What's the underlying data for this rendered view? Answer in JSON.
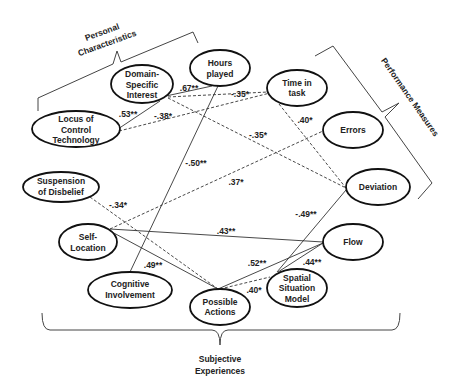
{
  "diagram": {
    "groups": {
      "personal_characteristics": {
        "line1": "Personal",
        "line2": "Characteristics"
      },
      "performance_measures": {
        "label": "Performance Measures"
      },
      "subjective_experiences": {
        "line1": "Subjective",
        "line2": "Experiences"
      }
    },
    "nodes": {
      "domain_specific_interest": {
        "lines": [
          "Domain-",
          "Specific",
          "Interest"
        ]
      },
      "hours_played": {
        "lines": [
          "Hours",
          "played"
        ]
      },
      "time_in_task": {
        "lines": [
          "Time in",
          "task"
        ]
      },
      "locus_of_control": {
        "lines": [
          "Locus of",
          "Control",
          "Technology"
        ]
      },
      "errors": {
        "lines": [
          "Errors"
        ]
      },
      "suspension_of_disbelief": {
        "lines": [
          "Suspension",
          "of Disbelief"
        ]
      },
      "deviation": {
        "lines": [
          "Deviation"
        ]
      },
      "self_location": {
        "lines": [
          "Self-",
          "Location"
        ]
      },
      "flow": {
        "lines": [
          "Flow"
        ]
      },
      "cognitive_involvement": {
        "lines": [
          "Cognitive",
          "Involvement"
        ]
      },
      "possible_actions": {
        "lines": [
          "Possible",
          "Actions"
        ]
      },
      "spatial_situation_model": {
        "lines": [
          "Spatial",
          "Situation",
          "Model"
        ]
      }
    },
    "edges": [
      {
        "from": "Domain-Specific Interest",
        "to": "Hours played",
        "style": "solid",
        "label": ".67**"
      },
      {
        "from": "Domain-Specific Interest",
        "to": "Time in task",
        "style": "dashed",
        "label": "-.35*"
      },
      {
        "from": "Domain-Specific Interest",
        "to": "Deviation",
        "style": "dashed",
        "label": "-.35*"
      },
      {
        "from": "Locus of Control Technology",
        "to": "Domain-Specific Interest",
        "style": "solid",
        "label": ".53**"
      },
      {
        "from": "Locus of Control Technology",
        "to": "Time in task",
        "style": "dashed",
        "label": "-.38*"
      },
      {
        "from": "Hours played",
        "to": "Cognitive Involvement",
        "style": "solid",
        "label": "-.50**"
      },
      {
        "from": "Self-Location",
        "to": "Errors",
        "style": "dashed",
        "label": ".37*"
      },
      {
        "from": "Time in task",
        "to": "Deviation",
        "style": "dashed",
        "label": ".40*"
      },
      {
        "from": "Suspension of Disbelief",
        "to": "Possible Actions",
        "style": "dashed",
        "label": "-.34*"
      },
      {
        "from": "Self-Location",
        "to": "Flow",
        "style": "solid",
        "label": ".43**"
      },
      {
        "from": "Self-Location",
        "to": "Possible Actions",
        "style": "solid",
        "label": ".49**"
      },
      {
        "from": "Deviation",
        "to": "Spatial Situation Model",
        "style": "solid",
        "label": "-.49**"
      },
      {
        "from": "Possible Actions",
        "to": "Flow",
        "style": "solid",
        "label": ".52**"
      },
      {
        "from": "Spatial Situation Model",
        "to": "Flow",
        "style": "solid",
        "label": ".44**"
      },
      {
        "from": "Possible Actions",
        "to": "Spatial Situation Model",
        "style": "dashed",
        "label": ".40*"
      }
    ]
  }
}
